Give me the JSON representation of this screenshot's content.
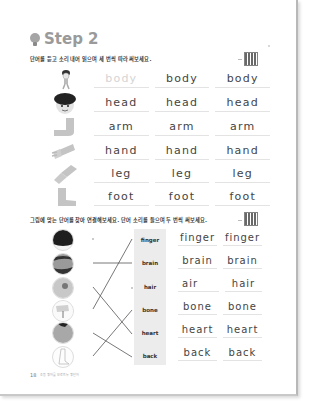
{
  "header": {
    "title": "Step 2",
    "icon": "lightbulb-icon",
    "accent_color": "#9a9a9a"
  },
  "section1": {
    "instruction": "단어를 듣고 소리 내어 읽으며 세 번씩 따라 써보세요.",
    "qr_icon": "qr-code-icon",
    "rows": [
      {
        "picture": "body-picture",
        "trace": "body",
        "copies": [
          "body",
          "body"
        ]
      },
      {
        "picture": "head-picture",
        "trace": "head",
        "copies": [
          "head",
          "head"
        ]
      },
      {
        "picture": "arm-picture",
        "trace": "arm",
        "copies": [
          "arm",
          "arm"
        ]
      },
      {
        "picture": "hand-picture",
        "trace": "hand",
        "copies": [
          "hand",
          "hand"
        ]
      },
      {
        "picture": "leg-picture",
        "trace": "leg",
        "copies": [
          "leg",
          "leg"
        ]
      },
      {
        "picture": "foot-picture",
        "trace": "foot",
        "copies": [
          "foot",
          "foot"
        ]
      }
    ]
  },
  "section2": {
    "instruction": "그림에 맞는 단어를 찾아 연결해보세요. 단어 소리를 들으며 두 번씩 써보세요.",
    "qr_icon": "qr-code-icon",
    "pictures": [
      "hair-picture",
      "brain-picture",
      "heart-picture",
      "bone-picture",
      "finger-picture",
      "back-picture"
    ],
    "words": [
      "finger",
      "brain",
      "hair",
      "bone",
      "heart",
      "back"
    ],
    "writing": [
      [
        "finger",
        "finger"
      ],
      [
        "brain",
        "brain"
      ],
      [
        "air",
        "hair"
      ],
      [
        "bone",
        "bone"
      ],
      [
        "heart",
        "heart"
      ],
      [
        "back",
        "back"
      ]
    ]
  },
  "footer": {
    "page_number": "18",
    "text": "초등 영어를 보로트뉴 영단어"
  }
}
